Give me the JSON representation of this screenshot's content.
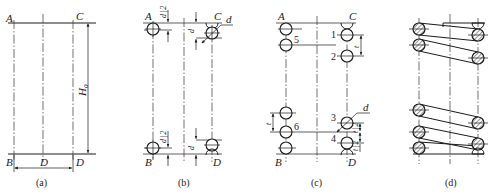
{
  "figure": {
    "panels": [
      {
        "id": "a",
        "caption": "(a)",
        "labels": {
          "A": "A",
          "B": "B",
          "C": "C",
          "D": "D",
          "height": "H",
          "height_sub": "0",
          "diameter": "D"
        }
      },
      {
        "id": "b",
        "caption": "(b)",
        "labels": {
          "A": "A",
          "B": "B",
          "C": "C",
          "D": "D",
          "wire_d": "d",
          "half_d_num": "d",
          "half_d_den": "2",
          "d_top": "d",
          "d_bottom": "d",
          "half_d_bottom_num": "d",
          "half_d_bottom_den": "2"
        }
      },
      {
        "id": "c",
        "caption": "(c)",
        "labels": {
          "A": "A",
          "B": "B",
          "C": "C",
          "D": "D",
          "wire_d": "d",
          "pitch_right": "t",
          "pitch_left": "t",
          "half_t_num": "t",
          "half_t_den": "2",
          "half_t2_num": "t",
          "half_t2_den": "2"
        },
        "circle_numbers": [
          "1",
          "2",
          "3",
          "4",
          "5",
          "6"
        ]
      },
      {
        "id": "d",
        "caption": "(d)",
        "labels": {}
      }
    ]
  }
}
